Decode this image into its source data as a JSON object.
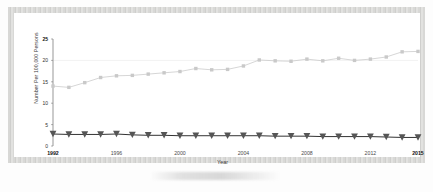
{
  "figure": {
    "axis_title_x": "Year",
    "axis_title_y": "Number Per 100,000 Persons"
  },
  "chart_data": {
    "type": "line",
    "title": "",
    "xlabel": "Year",
    "ylabel": "Number Per 100,000 Persons",
    "xlim": [
      1992,
      2015
    ],
    "ylim": [
      0,
      25
    ],
    "yticks": [
      0,
      5,
      10,
      15,
      20,
      25
    ],
    "ytick_labels": [
      "0",
      "5",
      "10",
      "15",
      "20",
      "25"
    ],
    "xticks": [
      1992,
      1996,
      2000,
      2004,
      2008,
      2012,
      2015
    ],
    "xtick_labels": [
      "1992",
      "1996",
      "2000",
      "2004",
      "2008",
      "2012",
      "2015"
    ],
    "grid": "horizontal-faint-at-20",
    "legend": "none",
    "x": [
      1992,
      1993,
      1994,
      1995,
      1996,
      1997,
      1998,
      1999,
      2000,
      2001,
      2002,
      2003,
      2004,
      2005,
      2006,
      2007,
      2008,
      2009,
      2010,
      2011,
      2012,
      2013,
      2014,
      2015
    ],
    "series": [
      {
        "name": "upper-series",
        "marker": "square",
        "color": "#c9c9c9",
        "line_color": "#c4c4c4",
        "values": [
          14.0,
          13.7,
          14.8,
          16.0,
          16.4,
          16.5,
          16.8,
          17.1,
          17.4,
          18.1,
          17.8,
          17.9,
          18.7,
          20.1,
          19.9,
          19.8,
          20.3,
          19.9,
          20.5,
          20.0,
          20.3,
          20.8,
          22.0,
          22.1
        ]
      },
      {
        "name": "lower-series",
        "marker": "triangle-down",
        "color": "#555555",
        "line_color": "#333333",
        "values": [
          2.8,
          2.7,
          2.7,
          2.7,
          2.8,
          2.6,
          2.5,
          2.5,
          2.4,
          2.4,
          2.4,
          2.4,
          2.4,
          2.4,
          2.3,
          2.3,
          2.3,
          2.2,
          2.2,
          2.2,
          2.2,
          2.1,
          2.0,
          2.0
        ]
      }
    ]
  }
}
